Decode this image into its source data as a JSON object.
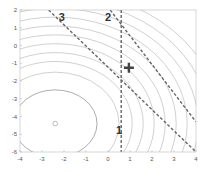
{
  "chart_data": {
    "type": "contour",
    "title": "",
    "xlabel": "",
    "ylabel": "",
    "xlim": [
      -4,
      4
    ],
    "ylim": [
      -6,
      2
    ],
    "x_ticks": [
      "-4",
      "-3",
      "-2",
      "-1",
      "0",
      "1",
      "2",
      "3",
      "4"
    ],
    "y_ticks": [
      "2",
      "1",
      "0",
      "-1",
      "-2",
      "-3",
      "-4",
      "-5",
      "-6"
    ],
    "grid": false,
    "contour_center": {
      "x": -2.4,
      "y": -4.4,
      "marker": "circle"
    },
    "contour_radii": [
      1.9,
      2.9,
      3.5,
      4.0,
      4.5,
      5.0,
      5.5,
      6.0,
      6.5,
      7.0,
      7.5
    ],
    "optimum_marker": {
      "x": 0.95,
      "y": -1.25,
      "marker": "plus"
    },
    "constraint_lines": [
      {
        "label": "1",
        "points": [
          [
            0.6,
            2
          ],
          [
            0.6,
            -6
          ]
        ],
        "label_pos": [
          0.5,
          -5.0
        ],
        "style": "dashed"
      },
      {
        "label": "2",
        "points": [
          [
            0.1,
            2
          ],
          [
            4,
            -4.3
          ]
        ],
        "label_pos": [
          0.0,
          1.4
        ],
        "style": "dashed"
      },
      {
        "label": "3",
        "points": [
          [
            -2.7,
            2
          ],
          [
            4,
            -6
          ]
        ],
        "label_pos": [
          -2.1,
          1.4
        ],
        "style": "dashed"
      }
    ]
  }
}
